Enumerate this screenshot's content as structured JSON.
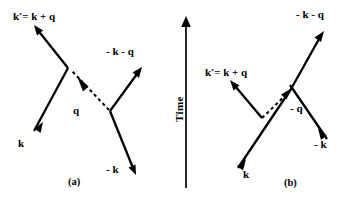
{
  "figure": {
    "background_color": "#ffffff",
    "ink_color": "#000000",
    "width": 354,
    "height": 202
  },
  "time_axis": {
    "label": "Time",
    "direction": "up",
    "x": 186,
    "y_top": 18,
    "y_bottom": 188
  },
  "panels": [
    {
      "id": "a",
      "caption": "(a)",
      "caption_x": 74,
      "caption_y": 183,
      "topology": "direct",
      "labels": [
        {
          "name": "k-prime-label",
          "text": "k′= k + q",
          "x": 13,
          "y": 20
        },
        {
          "name": "minus-k-minus-q-label",
          "text": "- k - q",
          "x": 107,
          "y": 55
        },
        {
          "name": "k-label",
          "text": "k",
          "x": 18,
          "y": 146
        },
        {
          "name": "minus-k-label",
          "text": "- k",
          "x": 108,
          "y": 171
        },
        {
          "name": "q-label",
          "text": "q",
          "x": 73,
          "y": 112
        }
      ],
      "lines": [
        {
          "name": "k-prime-outgoing-line",
          "x1": 68,
          "y1": 68,
          "x2": 36,
          "y2": 28,
          "arrow": "end"
        },
        {
          "name": "k-incoming-line",
          "x1": 31,
          "y1": 135,
          "x2": 68,
          "y2": 68,
          "arrow": "start"
        },
        {
          "name": "minus-k-minus-q-outgoing-line",
          "x1": 110,
          "y1": 110,
          "x2": 140,
          "y2": 70,
          "arrow": "end"
        },
        {
          "name": "minus-k-incoming-line",
          "x1": 131,
          "y1": 167,
          "x2": 110,
          "y2": 110,
          "arrow": "start"
        },
        {
          "name": "phonon-exchange-dashed-line",
          "x1": 110,
          "y1": 110,
          "x2": 70,
          "y2": 70,
          "arrow": "end-at-vertex"
        }
      ]
    },
    {
      "id": "b",
      "caption": "(b)",
      "caption_x": 289,
      "caption_y": 185,
      "topology": "exchange",
      "labels": [
        {
          "name": "k-prime-label",
          "text": "k′= k + q",
          "x": 207,
          "y": 75
        },
        {
          "name": "minus-k-minus-q-label",
          "text": "- k - q",
          "x": 297,
          "y": 17
        },
        {
          "name": "k-label",
          "text": "k",
          "x": 243,
          "y": 176
        },
        {
          "name": "minus-k-label",
          "text": "- k",
          "x": 316,
          "y": 145
        },
        {
          "name": "minus-q-label",
          "text": "- q",
          "x": 288,
          "y": 110
        }
      ],
      "lines": [
        {
          "name": "k-prime-outgoing-line",
          "x1": 262,
          "y1": 117,
          "x2": 231,
          "y2": 82,
          "arrow": "end"
        },
        {
          "name": "k-incoming-line",
          "x1": 235,
          "y1": 172,
          "x2": 262,
          "y2": 117,
          "arrow": "start"
        },
        {
          "name": "minus-k-minus-q-outgoing-line",
          "x1": 291,
          "y1": 88,
          "x2": 322,
          "y2": 33,
          "arrow": "end"
        },
        {
          "name": "minus-k-incoming-line",
          "x1": 325,
          "y1": 136,
          "x2": 291,
          "y2": 88,
          "arrow": "start"
        },
        {
          "name": "phonon-exchange-dashed-line",
          "x1": 262,
          "y1": 117,
          "x2": 290,
          "y2": 90,
          "arrow": "end-at-vertex"
        }
      ]
    }
  ]
}
